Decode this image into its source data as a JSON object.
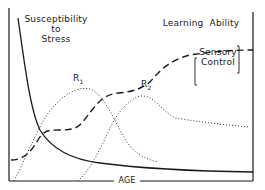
{
  "diagram": {
    "labels": {
      "susceptibility_line1": "Susceptibility",
      "susceptibility_line2": "to",
      "susceptibility_line3": "Stress",
      "learning_ability": "Learning  Ability",
      "sensory_line1": "Sensory",
      "sensory_line2": "Control",
      "r1": "R",
      "r1_sub": "1",
      "r2": "R",
      "r2_sub": "2",
      "x_axis": "AGE"
    },
    "curves": [
      {
        "name": "Susceptibility to Stress",
        "style": "solid",
        "shape": "steep decline then flat asymptote"
      },
      {
        "name": "Learning Ability",
        "style": "dashed",
        "shape": "sigmoid rise, plateau, second rise to plateau (Sensory Control)"
      },
      {
        "name": "R1",
        "style": "dotted",
        "shape": "early peaked curve"
      },
      {
        "name": "R2",
        "style": "dotted",
        "shape": "later peaked curve with long tail"
      }
    ],
    "colors": {
      "ink": "#1a1a1a",
      "background": "#ffffff"
    }
  }
}
